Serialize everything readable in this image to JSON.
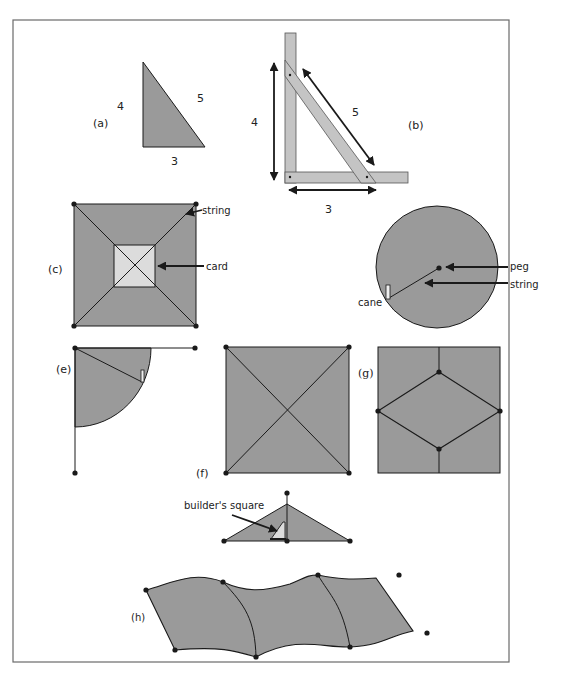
{
  "colors": {
    "fill": "#9a9a9a",
    "card": "#dcdcdc",
    "wood": "#c4c4c4",
    "stroke": "#1a1a1a",
    "frame": "#6a6a6a",
    "background": "#ffffff"
  },
  "panels": {
    "a": {
      "label": "(a)",
      "side_vertical": "4",
      "side_hypotenuse": "5",
      "side_base": "3"
    },
    "b": {
      "label": "(b)",
      "side_vertical": "4",
      "side_hypotenuse": "5",
      "side_base": "3"
    },
    "c": {
      "label": "(c)",
      "callout_string": "string",
      "callout_card": "card"
    },
    "d": {
      "callout_peg": "peg",
      "callout_string": "string",
      "callout_cane": "cane"
    },
    "e": {
      "label": "(e)"
    },
    "f": {
      "label": "(f)",
      "callout_builders_square": "builder's square"
    },
    "g": {
      "label": "(g)"
    },
    "h": {
      "label": "(h)"
    }
  }
}
